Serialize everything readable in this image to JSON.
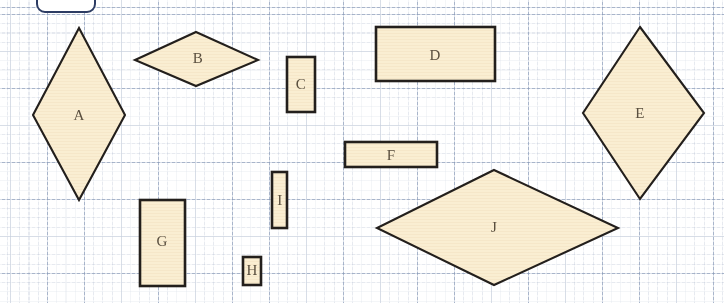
{
  "document": {
    "type": "geometry-worksheet",
    "title": "Shapes on dotted grid",
    "background_color": "#ffffff",
    "grid": {
      "visible": true,
      "major_spacing_px": 37,
      "minor_spacing_px": 9.25,
      "major_color": "#8294b4",
      "minor_color": "#afb9cd",
      "style": "dotted"
    },
    "shape_style": {
      "fill_color": "#faeed2",
      "stroke_color": "#231f1c",
      "label_color": "#5a4f3f"
    },
    "top_tab": {
      "name": "rounded-tab",
      "border_color": "#2d3c63",
      "label": ""
    }
  },
  "shapes": [
    {
      "label": "A",
      "kind": "rhombus",
      "points": "79,28 125,115 79,200 33,115",
      "label_x": 79,
      "label_y": 115
    },
    {
      "label": "B",
      "kind": "rhombus",
      "points": "196,32 258,60 196,86 135,60",
      "label_x": 198,
      "label_y": 58
    },
    {
      "label": "C",
      "kind": "rectangle",
      "x": 287,
      "y": 57,
      "width": 28,
      "height": 55,
      "label_x": 301,
      "label_y": 84
    },
    {
      "label": "D",
      "kind": "rectangle",
      "x": 376,
      "y": 27,
      "width": 119,
      "height": 54,
      "label_x": 435,
      "label_y": 55
    },
    {
      "label": "E",
      "kind": "rhombus",
      "points": "640,27 704,113 640,199 583,113",
      "label_x": 640,
      "label_y": 113
    },
    {
      "label": "F",
      "kind": "rectangle",
      "x": 345,
      "y": 142,
      "width": 92,
      "height": 25,
      "label_x": 391,
      "label_y": 155
    },
    {
      "label": "G",
      "kind": "rectangle",
      "x": 140,
      "y": 200,
      "width": 45,
      "height": 86,
      "label_x": 162,
      "label_y": 241
    },
    {
      "label": "H",
      "kind": "rectangle",
      "x": 243,
      "y": 257,
      "width": 18,
      "height": 28,
      "label_x": 252,
      "label_y": 270
    },
    {
      "label": "I",
      "kind": "rectangle",
      "x": 272,
      "y": 172,
      "width": 15,
      "height": 56,
      "label_x": 280,
      "label_y": 200
    },
    {
      "label": "J",
      "kind": "rhombus",
      "points": "494,170 618,228 494,285 377,228",
      "label_x": 494,
      "label_y": 227
    }
  ]
}
